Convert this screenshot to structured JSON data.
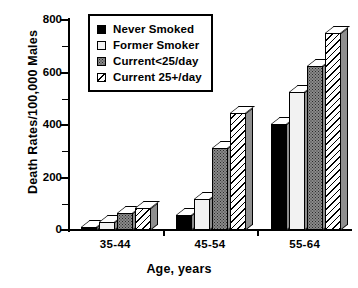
{
  "chart_data": {
    "type": "bar",
    "title": "",
    "xlabel": "Age, years",
    "ylabel": "Death Rates/100,000 Males",
    "categories": [
      "35-44",
      "45-54",
      "55-64"
    ],
    "series": [
      {
        "name": "Never Smoked",
        "values": [
          13,
          57,
          404
        ],
        "pattern": "solid-black"
      },
      {
        "name": "Former Smoker",
        "values": [
          30,
          118,
          525
        ],
        "pattern": "white"
      },
      {
        "name": "Current<25/day",
        "values": [
          65,
          312,
          625
        ],
        "pattern": "gray-stipple"
      },
      {
        "name": "Current 25+/day",
        "values": [
          84,
          446,
          750
        ],
        "pattern": "diagonal-hatch"
      }
    ],
    "ylim": [
      0,
      800
    ],
    "ytick_labels": [
      "0",
      "200",
      "400",
      "600",
      "800"
    ],
    "ytick_values": [
      0,
      200,
      400,
      600,
      800
    ],
    "yminor_tick_values": [
      100,
      300,
      500,
      700
    ],
    "grid": false,
    "legend_position": "top-left",
    "style": "3d-extruded-bars",
    "colors": {
      "axis": "#000000",
      "never_smoked": "#000000",
      "former_smoker": "#f2f2f2",
      "current_lt25": "#8a8a8a",
      "current_25plus": "#ffffff",
      "bar_side": "#8e8e8e",
      "background": "#ffffff"
    }
  },
  "legend": {
    "items": [
      {
        "label": "Never Smoked"
      },
      {
        "label": "Former Smoker"
      },
      {
        "label": "Current<25/day"
      },
      {
        "label": "Current 25+/day"
      }
    ]
  }
}
